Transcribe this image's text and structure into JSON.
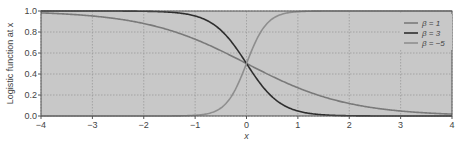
{
  "chart_data": {
    "type": "line",
    "title": "",
    "xlabel": "x",
    "ylabel": "Logistic function at x",
    "xlim": [
      -4,
      4
    ],
    "ylim": [
      0,
      1
    ],
    "xticks": [
      -4,
      -3,
      -2,
      -1,
      0,
      1,
      2,
      3,
      4
    ],
    "xtick_labels": [
      "−4",
      "−3",
      "−2",
      "−1",
      "0",
      "1",
      "2",
      "3",
      "4"
    ],
    "yticks": [
      0.0,
      0.2,
      0.4,
      0.6,
      0.8,
      1.0
    ],
    "ytick_labels": [
      "0.0",
      "0.2",
      "0.4",
      "0.6",
      "0.8",
      "1.0"
    ],
    "grid": true,
    "background": "#c8c8c8",
    "legend_position": "upper right",
    "function": "1 / (1 + exp(beta * x))",
    "x": [
      -4,
      -3,
      -2,
      -1,
      -0.5,
      0,
      0.5,
      1,
      2,
      3,
      4
    ],
    "series": [
      {
        "name": "β = 1",
        "beta": 1,
        "color": "#7a7a7a",
        "values": [
          0.98,
          0.95,
          0.88,
          0.73,
          0.62,
          0.5,
          0.38,
          0.27,
          0.12,
          0.05,
          0.02
        ]
      },
      {
        "name": "β = 3",
        "beta": 3,
        "color": "#2e2e2e",
        "values": [
          1.0,
          1.0,
          1.0,
          0.95,
          0.82,
          0.5,
          0.18,
          0.05,
          0.0,
          0.0,
          0.0
        ]
      },
      {
        "name": "β = −5",
        "beta": -5,
        "color": "#8e8e8e",
        "values": [
          0.0,
          0.0,
          0.0,
          0.01,
          0.08,
          0.5,
          0.92,
          0.99,
          1.0,
          1.0,
          1.0
        ]
      }
    ]
  },
  "legend": {
    "items": [
      {
        "label": "β = 1",
        "color": "#7a7a7a"
      },
      {
        "label": "β = 3",
        "color": "#2e2e2e"
      },
      {
        "label": "β = −5",
        "color": "#8e8e8e"
      }
    ]
  }
}
